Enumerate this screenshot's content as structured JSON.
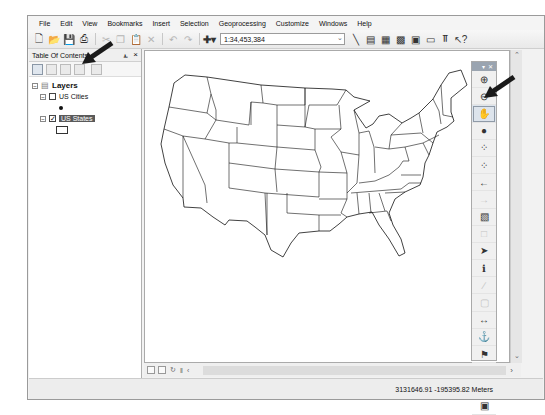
{
  "menu": [
    "File",
    "Edit",
    "View",
    "Bookmarks",
    "Insert",
    "Selection",
    "Geoprocessing",
    "Customize",
    "Windows",
    "Help"
  ],
  "toolbar": {
    "buttons": [
      "new-document",
      "open",
      "save",
      "print",
      "cut",
      "copy",
      "paste",
      "delete",
      "undo",
      "redo",
      "add-data"
    ],
    "scale": "1:34,453,384",
    "right_buttons": [
      "editor",
      "table-of-contents",
      "catalog",
      "search",
      "arctoolbox",
      "python",
      "model-builder",
      "whats-this"
    ]
  },
  "toc": {
    "title": "Table Of Contents",
    "pin": "⫠",
    "close": "×",
    "tools": [
      "list-by-drawing-order",
      "list-by-source",
      "list-by-visibility",
      "list-by-selection",
      "options"
    ],
    "root": "Layers",
    "layers": [
      {
        "name": "US Cities",
        "checked": false,
        "symbol": "point"
      },
      {
        "name": "US States",
        "checked": true,
        "selected": true,
        "symbol": "polygon"
      }
    ]
  },
  "tools_palette": {
    "items": [
      {
        "name": "zoom-in",
        "glyph": "⊕"
      },
      {
        "name": "zoom-out",
        "glyph": "⊖"
      },
      {
        "name": "pan",
        "glyph": "✋",
        "active": true
      },
      {
        "name": "full-extent",
        "glyph": "●"
      },
      {
        "name": "fixed-zoom-in",
        "glyph": "⁘"
      },
      {
        "name": "fixed-zoom-out",
        "glyph": "⁘"
      },
      {
        "name": "back-extent",
        "glyph": "←"
      },
      {
        "name": "forward-extent",
        "glyph": "→",
        "dim": true
      },
      {
        "name": "select-features",
        "glyph": "▧"
      },
      {
        "name": "clear-selection",
        "glyph": "□",
        "dim": true
      },
      {
        "name": "select-elements",
        "glyph": "➤"
      },
      {
        "name": "identify",
        "glyph": "ℹ"
      },
      {
        "name": "hyperlink",
        "glyph": "∕",
        "dim": true
      },
      {
        "name": "html-popup",
        "glyph": "▢",
        "dim": true
      },
      {
        "name": "measure",
        "glyph": "↔"
      },
      {
        "name": "find",
        "glyph": "⚓"
      },
      {
        "name": "find-route",
        "glyph": "⚑"
      },
      {
        "name": "go-to-xy",
        "glyph": "XY"
      },
      {
        "name": "time-slider",
        "glyph": "▢",
        "dim": true
      },
      {
        "name": "create-viewer-window",
        "glyph": "▣"
      }
    ]
  },
  "status": {
    "coordinates": "3131646.91  -195395.82 Meters"
  },
  "colors": {
    "arrow": "#1a1a1a",
    "selection": "#5a5a5a",
    "map_bg": "#ffffff",
    "state_outline": "#111111"
  }
}
